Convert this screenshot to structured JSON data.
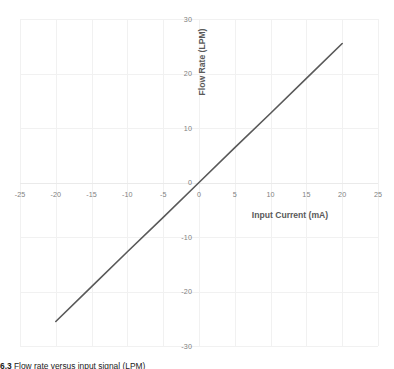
{
  "chart_data": {
    "type": "line",
    "title": "",
    "xlabel": "Input Current (mA)",
    "ylabel": "Flow Rate (LPM)",
    "xlim": [
      -25,
      25
    ],
    "ylim": [
      -30,
      30
    ],
    "xticks": [
      "-25",
      "-20",
      "-15",
      "-10",
      "-5",
      "0",
      "5",
      "10",
      "15",
      "20",
      "25"
    ],
    "xtick_values": [
      -25,
      -20,
      -15,
      -10,
      -5,
      0,
      5,
      10,
      15,
      20,
      25
    ],
    "yticks": [
      "30",
      "20",
      "10",
      "0",
      "-10",
      "-20",
      "-30"
    ],
    "ytick_values": [
      30,
      20,
      10,
      0,
      -10,
      -20,
      -30
    ],
    "grid": true,
    "legend": "none",
    "series": [
      {
        "name": "Flow Rate vs Input Current",
        "color": "#595959",
        "x": [
          -20,
          -15,
          -10,
          -5,
          0,
          5,
          10,
          15,
          20
        ],
        "values": [
          -25.5,
          -19.1,
          -12.7,
          -6.4,
          0,
          6.4,
          12.7,
          19.1,
          25.5
        ]
      }
    ],
    "annotations": []
  },
  "caption": {
    "number": "6.3",
    "text": "Flow rate versus input signal (LPM)"
  },
  "colors": {
    "series_line": "#595959",
    "gridline": "#f1f1f1",
    "tick_text": "#7f7f7f",
    "axis_title": "#595959",
    "background": "#ffffff"
  }
}
